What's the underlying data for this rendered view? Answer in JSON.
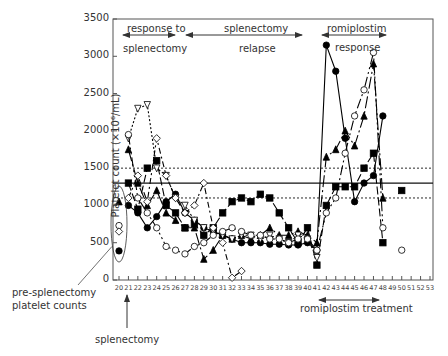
{
  "chart_data": {
    "type": "line",
    "title": "",
    "xlabel": "",
    "ylabel": "Platelet count (×10⁶/mL)",
    "ylim": [
      0,
      3500
    ],
    "xlim": [
      20,
      53
    ],
    "yticks": [
      0,
      500,
      1000,
      1500,
      2000,
      2500,
      3000,
      3500
    ],
    "xticks": [
      20,
      21,
      22,
      23,
      24,
      25,
      26,
      27,
      28,
      29,
      30,
      31,
      32,
      33,
      34,
      35,
      36,
      37,
      38,
      39,
      40,
      41,
      42,
      43,
      44,
      45,
      46,
      47,
      48,
      49,
      50,
      51,
      52,
      53
    ],
    "reference_lines": [
      {
        "y": 1300,
        "style": "solid"
      },
      {
        "y": 1500,
        "style": "dotted"
      },
      {
        "y": 1100,
        "style": "dotted"
      }
    ],
    "pre_splenectomy_points": [
      {
        "marker": "triangle-filled",
        "x": 20,
        "y": 1050
      },
      {
        "marker": "circle-open",
        "x": 20,
        "y": 730
      },
      {
        "marker": "diamond-open",
        "x": 20,
        "y": 650
      },
      {
        "marker": "circle-filled",
        "x": 20,
        "y": 390
      }
    ],
    "series": [
      {
        "name": "patient-circle-filled",
        "marker": "circle-filled",
        "dash": "none",
        "x": [
          21,
          22,
          23,
          24,
          25,
          26,
          27,
          28,
          29,
          30,
          31,
          32,
          33,
          34,
          35,
          36,
          37,
          38,
          39,
          40,
          41,
          42,
          43,
          44,
          45,
          46,
          47,
          48
        ],
        "y": [
          1000,
          900,
          700,
          850,
          1050,
          1150,
          900,
          800,
          700,
          650,
          600,
          550,
          500,
          500,
          500,
          480,
          480,
          470,
          470,
          500,
          400,
          3150,
          2800,
          1900,
          1050,
          1300,
          1400,
          2200
        ]
      },
      {
        "name": "patient-square-filled",
        "marker": "square-filled",
        "dash": "8,3",
        "x": [
          21,
          22,
          23,
          24,
          25,
          26,
          27,
          28,
          29,
          30,
          31,
          32,
          33,
          34,
          35,
          36,
          37,
          38,
          39,
          40,
          41,
          42,
          43,
          44,
          45,
          46,
          47,
          48,
          50
        ],
        "y": [
          1300,
          950,
          1500,
          1600,
          1000,
          900,
          700,
          750,
          600,
          700,
          900,
          1050,
          1100,
          1050,
          1150,
          1100,
          900,
          700,
          500,
          700,
          200,
          1000,
          1250,
          1250,
          1250,
          1500,
          1700,
          500,
          1200
        ]
      },
      {
        "name": "patient-triangle-filled",
        "marker": "triangle-filled",
        "dash": "12,3,2,3",
        "x": [
          21,
          22,
          23,
          24,
          25,
          26,
          27,
          28,
          29,
          30,
          31,
          32,
          33,
          34,
          35,
          36,
          37,
          38,
          39,
          40,
          41,
          42,
          43,
          44,
          45,
          46,
          47,
          48
        ],
        "y": [
          1750,
          1300,
          1000,
          1200,
          900,
          800,
          700,
          700,
          280,
          400,
          600,
          550,
          600,
          550,
          600,
          700,
          600,
          600,
          650,
          600,
          500,
          1650,
          1750,
          2000,
          1800,
          2200,
          2900,
          1100
        ]
      },
      {
        "name": "patient-triangle-open",
        "marker": "triangle-open",
        "dash": "2,2",
        "x": [
          21,
          22,
          23,
          24,
          25,
          26,
          27,
          28,
          29,
          30,
          31,
          32,
          33,
          34,
          35,
          36,
          37,
          38,
          39,
          40,
          41
        ],
        "y": [
          1900,
          2300,
          2350,
          1500,
          1400,
          1100,
          1000,
          800,
          700,
          650,
          600,
          550,
          600,
          600,
          550,
          600,
          550,
          500,
          600,
          550,
          300
        ]
      },
      {
        "name": "patient-circle-open",
        "marker": "circle-open",
        "dash": "10,3,2,3,2,3",
        "x": [
          21,
          22,
          23,
          24,
          25,
          26,
          27,
          28,
          29,
          30,
          31,
          32,
          33,
          34,
          35,
          36,
          37,
          38,
          39,
          40,
          41,
          42,
          43,
          44,
          45,
          46,
          47,
          48,
          50
        ],
        "y": [
          1950,
          1100,
          900,
          700,
          450,
          400,
          350,
          450,
          500,
          600,
          650,
          700,
          650,
          600,
          600,
          550,
          550,
          500,
          550,
          550,
          400,
          900,
          1100,
          1700,
          2200,
          2550,
          3050,
          700,
          400
        ]
      },
      {
        "name": "patient-diamond-open",
        "marker": "diamond-open",
        "dash": "6,3,2,3",
        "x": [
          21,
          22,
          23,
          24,
          25,
          26,
          27,
          28,
          29,
          30,
          31,
          32,
          33
        ],
        "y": [
          1100,
          1400,
          1050,
          1900,
          1400,
          1100,
          900,
          1000,
          1300,
          700,
          500,
          30,
          120
        ]
      }
    ],
    "annotations": [
      {
        "text": "response to",
        "x_range": [
          21,
          25
        ]
      },
      {
        "text": "splenectomy",
        "x_range": [
          21,
          25
        ]
      },
      {
        "text": "splenectomy",
        "x_range": [
          26,
          39
        ]
      },
      {
        "text": "relapse",
        "x_range": [
          26,
          39
        ]
      },
      {
        "text": "romiplostim",
        "x_range": [
          41,
          47
        ]
      },
      {
        "text": "response",
        "x_range": [
          41,
          47
        ]
      },
      {
        "text": "romiplostim treatment",
        "x_range": [
          42,
          48
        ]
      },
      {
        "text": "pre-splenectomy platelet counts"
      },
      {
        "text": "splenectomy",
        "x": 21
      }
    ]
  },
  "labels": {
    "resp_to": "response to",
    "resp_splen": "splenectomy",
    "relapse_top": "splenectomy",
    "relapse_bottom": "relapse",
    "romi_top": "romiplostim",
    "romi_bottom": "response",
    "romi_treatment": "romiplostim treatment",
    "pre_splen_1": "pre-splenectomy",
    "pre_splen_2": "platelet counts",
    "splenectomy_arrow": "splenectomy",
    "ylabel": "Platelet count (×10⁶/mL)"
  }
}
